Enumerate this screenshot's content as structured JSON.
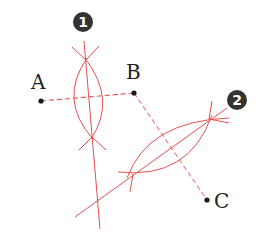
{
  "diagram": {
    "colors": {
      "construction": "#e8504f",
      "segment_dashed": "#e8504f",
      "segment_dashed_bc": "#e07f86",
      "point": "#1a1a1a",
      "label": "#222222",
      "badge_fill": "#333333",
      "badge_text": "#ffffff"
    },
    "points": [
      {
        "name": "A",
        "label": "A",
        "x": 41,
        "y": 101,
        "label_x": 31,
        "label_y": 89
      },
      {
        "name": "B",
        "label": "B",
        "x": 134,
        "y": 93,
        "label_x": 126,
        "label_y": 79
      },
      {
        "name": "C",
        "label": "C",
        "x": 207,
        "y": 200,
        "label_x": 214,
        "label_y": 208
      }
    ],
    "segments": [
      {
        "from": "A",
        "to": "B",
        "style": "dashed"
      },
      {
        "from": "B",
        "to": "C",
        "style": "dashed"
      }
    ],
    "badges": [
      {
        "label": "1",
        "x": 83,
        "y": 22
      },
      {
        "label": "2",
        "x": 237,
        "y": 100
      }
    ],
    "bisector_1": {
      "line": {
        "x1": 84,
        "y1": 41,
        "x2": 100,
        "y2": 229
      },
      "arc_left": "M 87 58 Q 58 100 93 139",
      "arc_right": "M 85 58 Q 117 100 91 139",
      "tick_top_left": "M 72 47 L 86 60",
      "tick_top_right": "M 99 46 L 86 60",
      "tick_bottom_left": "M 79 150 L 92 137",
      "tick_bottom_right": "M 106 150 L 92 137"
    },
    "bisector_2": {
      "line": {
        "x1": 227,
        "y1": 108,
        "x2": 75,
        "y2": 217
      },
      "arc_upper": "M 127 178 Q 148 121 229 118",
      "arc_lower": "M 118 172 Q 189 180 212 115",
      "tick_upper_top": "M 212 101 L 209 119",
      "tick_upper_right": "M 229 123 L 209 119",
      "tick_lower_bottom": "M 130 192 L 133 174"
    }
  }
}
